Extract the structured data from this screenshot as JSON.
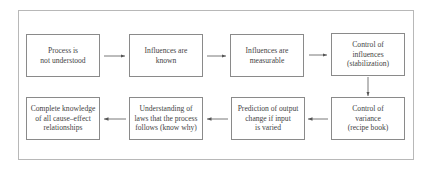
{
  "diagram": {
    "type": "flowchart",
    "rows": 2,
    "boxes": [
      {
        "id": 1,
        "label": "Process is\nnot understood"
      },
      {
        "id": 2,
        "label": "Influences are\nknown"
      },
      {
        "id": 3,
        "label": "Influences are\nmeasurable"
      },
      {
        "id": 4,
        "label": "Control of\ninfluences\n(stabilization)"
      },
      {
        "id": 5,
        "label": "Control of\nvariance\n(recipe book)"
      },
      {
        "id": 6,
        "label": "Prediction of output\nchange if input\nis varied"
      },
      {
        "id": 7,
        "label": "Understanding of\nlaws that the process\nfollows (know why)"
      },
      {
        "id": 8,
        "label": "Complete knowledge\nof all cause–effect\nrelationships"
      }
    ],
    "edges": [
      {
        "from": 1,
        "to": 2
      },
      {
        "from": 2,
        "to": 3
      },
      {
        "from": 3,
        "to": 4
      },
      {
        "from": 4,
        "to": 5
      },
      {
        "from": 5,
        "to": 6
      },
      {
        "from": 6,
        "to": 7
      },
      {
        "from": 7,
        "to": 8
      }
    ],
    "colors": {
      "frame": "#b8b8b8",
      "box_border": "#8a8a8a",
      "arrow": "#555555",
      "text": "#444444"
    }
  }
}
